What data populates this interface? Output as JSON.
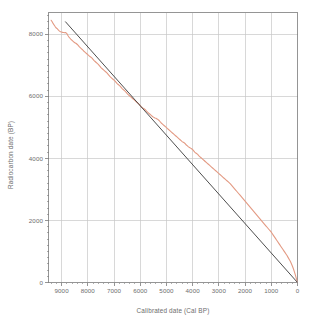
{
  "chart_data": {
    "type": "line",
    "title": "",
    "xlabel": "Calibrated date (Cal BP)",
    "ylabel": "Radiocarbon date (BP)",
    "xlim": [
      9500,
      0
    ],
    "ylim": [
      0,
      8700
    ],
    "x_reversed": true,
    "grid": true,
    "legend_position": "none",
    "xticks": [
      9000,
      8000,
      7000,
      6000,
      5000,
      4000,
      3000,
      2000,
      1000,
      0
    ],
    "xticklabels": [
      "9000",
      "8000",
      "7000",
      "6000",
      "5000",
      "4000",
      "3000",
      "2000",
      "1000",
      "0"
    ],
    "yticks": [
      0,
      2000,
      4000,
      6000,
      8000
    ],
    "yticklabels": [
      "0",
      "2000",
      "4000",
      "6000",
      "8000"
    ],
    "x_minor_tick_step": 200,
    "y_minor_tick_step": 200,
    "series": [
      {
        "name": "Calibration curve",
        "color": "#e39a83",
        "type": "line",
        "linewidth": 1.1,
        "points": [
          [
            9400,
            8450
          ],
          [
            9360,
            8400
          ],
          [
            9320,
            8340
          ],
          [
            9280,
            8290
          ],
          [
            9240,
            8240
          ],
          [
            9200,
            8200
          ],
          [
            9160,
            8170
          ],
          [
            9120,
            8130
          ],
          [
            9080,
            8100
          ],
          [
            9040,
            8080
          ],
          [
            9000,
            8070
          ],
          [
            8960,
            8060
          ],
          [
            8920,
            8055
          ],
          [
            8880,
            8050
          ],
          [
            8840,
            8050
          ],
          [
            8800,
            8020
          ],
          [
            8760,
            7960
          ],
          [
            8720,
            7910
          ],
          [
            8680,
            7870
          ],
          [
            8640,
            7830
          ],
          [
            8600,
            7800
          ],
          [
            8560,
            7770
          ],
          [
            8520,
            7740
          ],
          [
            8480,
            7720
          ],
          [
            8440,
            7700
          ],
          [
            8400,
            7670
          ],
          [
            8360,
            7630
          ],
          [
            8320,
            7590
          ],
          [
            8280,
            7560
          ],
          [
            8240,
            7530
          ],
          [
            8200,
            7500
          ],
          [
            8160,
            7460
          ],
          [
            8120,
            7430
          ],
          [
            8080,
            7400
          ],
          [
            8040,
            7370
          ],
          [
            8000,
            7340
          ],
          [
            7960,
            7310
          ],
          [
            7920,
            7280
          ],
          [
            7880,
            7260
          ],
          [
            7840,
            7230
          ],
          [
            7800,
            7190
          ],
          [
            7760,
            7150
          ],
          [
            7720,
            7120
          ],
          [
            7680,
            7090
          ],
          [
            7640,
            7060
          ],
          [
            7600,
            7030
          ],
          [
            7560,
            6990
          ],
          [
            7520,
            6950
          ],
          [
            7480,
            6910
          ],
          [
            7440,
            6880
          ],
          [
            7400,
            6850
          ],
          [
            7360,
            6820
          ],
          [
            7320,
            6790
          ],
          [
            7280,
            6760
          ],
          [
            7240,
            6720
          ],
          [
            7200,
            6680
          ],
          [
            7160,
            6640
          ],
          [
            7120,
            6610
          ],
          [
            7080,
            6580
          ],
          [
            7040,
            6550
          ],
          [
            7000,
            6520
          ],
          [
            6960,
            6490
          ],
          [
            6920,
            6450
          ],
          [
            6880,
            6410
          ],
          [
            6840,
            6380
          ],
          [
            6800,
            6350
          ],
          [
            6760,
            6320
          ],
          [
            6720,
            6280
          ],
          [
            6680,
            6240
          ],
          [
            6640,
            6210
          ],
          [
            6600,
            6180
          ],
          [
            6560,
            6150
          ],
          [
            6520,
            6110
          ],
          [
            6480,
            6070
          ],
          [
            6440,
            6040
          ],
          [
            6400,
            6010
          ],
          [
            6360,
            5980
          ],
          [
            6320,
            5950
          ],
          [
            6280,
            5920
          ],
          [
            6240,
            5890
          ],
          [
            6200,
            5860
          ],
          [
            6160,
            5830
          ],
          [
            6120,
            5800
          ],
          [
            6080,
            5770
          ],
          [
            6040,
            5740
          ],
          [
            6000,
            5700
          ],
          [
            5960,
            5660
          ],
          [
            5920,
            5630
          ],
          [
            5880,
            5610
          ],
          [
            5840,
            5590
          ],
          [
            5800,
            5560
          ],
          [
            5760,
            5520
          ],
          [
            5720,
            5490
          ],
          [
            5680,
            5460
          ],
          [
            5640,
            5430
          ],
          [
            5600,
            5400
          ],
          [
            5560,
            5370
          ],
          [
            5520,
            5340
          ],
          [
            5480,
            5320
          ],
          [
            5440,
            5300
          ],
          [
            5400,
            5290
          ],
          [
            5360,
            5270
          ],
          [
            5320,
            5250
          ],
          [
            5280,
            5220
          ],
          [
            5240,
            5180
          ],
          [
            5200,
            5140
          ],
          [
            5160,
            5110
          ],
          [
            5120,
            5080
          ],
          [
            5080,
            5050
          ],
          [
            5040,
            5020
          ],
          [
            5000,
            4990
          ],
          [
            4960,
            4960
          ],
          [
            4920,
            4930
          ],
          [
            4880,
            4900
          ],
          [
            4840,
            4870
          ],
          [
            4800,
            4840
          ],
          [
            4760,
            4810
          ],
          [
            4720,
            4780
          ],
          [
            4680,
            4750
          ],
          [
            4640,
            4720
          ],
          [
            4600,
            4690
          ],
          [
            4560,
            4660
          ],
          [
            4520,
            4630
          ],
          [
            4480,
            4600
          ],
          [
            4440,
            4570
          ],
          [
            4400,
            4540
          ],
          [
            4360,
            4520
          ],
          [
            4320,
            4500
          ],
          [
            4280,
            4470
          ],
          [
            4240,
            4430
          ],
          [
            4200,
            4400
          ],
          [
            4160,
            4370
          ],
          [
            4120,
            4350
          ],
          [
            4080,
            4330
          ],
          [
            4040,
            4310
          ],
          [
            4000,
            4280
          ],
          [
            3960,
            4240
          ],
          [
            3920,
            4200
          ],
          [
            3880,
            4170
          ],
          [
            3840,
            4150
          ],
          [
            3800,
            4120
          ],
          [
            3760,
            4080
          ],
          [
            3720,
            4050
          ],
          [
            3680,
            4020
          ],
          [
            3640,
            3990
          ],
          [
            3600,
            3960
          ],
          [
            3560,
            3930
          ],
          [
            3520,
            3900
          ],
          [
            3480,
            3870
          ],
          [
            3440,
            3840
          ],
          [
            3400,
            3810
          ],
          [
            3360,
            3780
          ],
          [
            3320,
            3750
          ],
          [
            3280,
            3720
          ],
          [
            3240,
            3690
          ],
          [
            3200,
            3660
          ],
          [
            3160,
            3630
          ],
          [
            3120,
            3600
          ],
          [
            3080,
            3570
          ],
          [
            3040,
            3540
          ],
          [
            3000,
            3510
          ],
          [
            2960,
            3480
          ],
          [
            2920,
            3450
          ],
          [
            2880,
            3420
          ],
          [
            2840,
            3390
          ],
          [
            2800,
            3360
          ],
          [
            2760,
            3330
          ],
          [
            2720,
            3300
          ],
          [
            2680,
            3270
          ],
          [
            2640,
            3240
          ],
          [
            2600,
            3210
          ],
          [
            2560,
            3180
          ],
          [
            2520,
            3140
          ],
          [
            2480,
            3100
          ],
          [
            2440,
            3060
          ],
          [
            2400,
            3020
          ],
          [
            2360,
            2980
          ],
          [
            2320,
            2940
          ],
          [
            2280,
            2900
          ],
          [
            2240,
            2860
          ],
          [
            2200,
            2820
          ],
          [
            2160,
            2780
          ],
          [
            2120,
            2740
          ],
          [
            2080,
            2700
          ],
          [
            2040,
            2660
          ],
          [
            2000,
            2620
          ],
          [
            1960,
            2580
          ],
          [
            1920,
            2540
          ],
          [
            1880,
            2500
          ],
          [
            1840,
            2460
          ],
          [
            1800,
            2420
          ],
          [
            1760,
            2380
          ],
          [
            1720,
            2340
          ],
          [
            1680,
            2300
          ],
          [
            1640,
            2260
          ],
          [
            1600,
            2220
          ],
          [
            1560,
            2180
          ],
          [
            1520,
            2140
          ],
          [
            1480,
            2100
          ],
          [
            1440,
            2060
          ],
          [
            1400,
            2020
          ],
          [
            1360,
            1980
          ],
          [
            1320,
            1940
          ],
          [
            1280,
            1900
          ],
          [
            1240,
            1860
          ],
          [
            1200,
            1820
          ],
          [
            1160,
            1780
          ],
          [
            1120,
            1740
          ],
          [
            1080,
            1700
          ],
          [
            1040,
            1660
          ],
          [
            1000,
            1620
          ],
          [
            960,
            1570
          ],
          [
            920,
            1520
          ],
          [
            880,
            1470
          ],
          [
            840,
            1420
          ],
          [
            800,
            1370
          ],
          [
            760,
            1320
          ],
          [
            720,
            1270
          ],
          [
            680,
            1220
          ],
          [
            640,
            1170
          ],
          [
            600,
            1120
          ],
          [
            560,
            1070
          ],
          [
            520,
            1020
          ],
          [
            480,
            970
          ],
          [
            440,
            920
          ],
          [
            400,
            870
          ],
          [
            360,
            810
          ],
          [
            320,
            750
          ],
          [
            280,
            690
          ],
          [
            240,
            620
          ],
          [
            200,
            540
          ],
          [
            160,
            450
          ],
          [
            120,
            350
          ],
          [
            80,
            240
          ],
          [
            40,
            120
          ],
          [
            0,
            0
          ]
        ]
      },
      {
        "name": "1:1 reference line",
        "color": "#3a3a3a",
        "type": "line",
        "linewidth": 0.9,
        "points": [
          [
            8850,
            8400
          ],
          [
            0,
            0
          ]
        ]
      }
    ]
  },
  "axes": {
    "x_axis_label": "Calibrated date (Cal BP)",
    "y_axis_label": "Radiocarbon date (BP)"
  },
  "colors": {
    "background": "#ffffff",
    "grid": "#c8c8c8",
    "frame": "#7a7a7a",
    "text": "#6d6d6d",
    "curve": "#e39a83",
    "reference_line": "#3a3a3a"
  }
}
